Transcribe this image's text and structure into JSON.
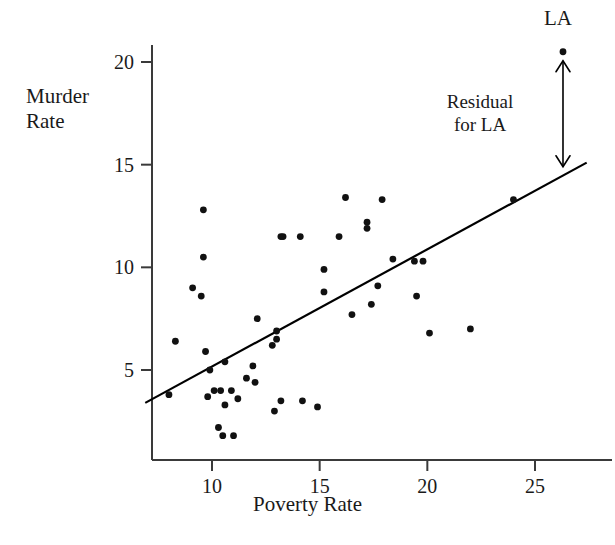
{
  "chart_data": {
    "type": "scatter",
    "title": "",
    "xlabel": "Poverty Rate",
    "ylabel": "Murder Rate",
    "xlim": [
      6.8,
      27.5
    ],
    "ylim": [
      0.5,
      21.5
    ],
    "grid": false,
    "legend": "none",
    "xticks": [
      10,
      15,
      20,
      25
    ],
    "yticks": [
      5,
      10,
      15,
      20
    ],
    "xtick_labels": [
      "10",
      "15",
      "20",
      "25"
    ],
    "ytick_labels": [
      "5",
      "10",
      "15",
      "20"
    ],
    "points": [
      [
        8.0,
        3.8
      ],
      [
        8.3,
        6.4
      ],
      [
        9.1,
        9.0
      ],
      [
        9.6,
        12.8
      ],
      [
        9.6,
        10.5
      ],
      [
        9.5,
        8.6
      ],
      [
        9.7,
        5.9
      ],
      [
        9.9,
        5.0
      ],
      [
        9.8,
        3.7
      ],
      [
        10.1,
        4.0
      ],
      [
        10.3,
        2.2
      ],
      [
        10.4,
        4.0
      ],
      [
        10.5,
        1.8
      ],
      [
        10.6,
        5.4
      ],
      [
        10.6,
        3.3
      ],
      [
        10.9,
        4.0
      ],
      [
        11.0,
        1.8
      ],
      [
        11.2,
        3.6
      ],
      [
        11.6,
        4.6
      ],
      [
        11.9,
        5.2
      ],
      [
        12.0,
        4.4
      ],
      [
        12.1,
        7.5
      ],
      [
        12.8,
        6.2
      ],
      [
        12.9,
        3.0
      ],
      [
        13.0,
        6.9
      ],
      [
        13.0,
        6.5
      ],
      [
        13.2,
        11.5
      ],
      [
        13.3,
        11.5
      ],
      [
        13.2,
        3.5
      ],
      [
        14.1,
        11.5
      ],
      [
        14.2,
        3.5
      ],
      [
        14.9,
        3.2
      ],
      [
        15.2,
        9.9
      ],
      [
        15.2,
        8.8
      ],
      [
        15.9,
        11.5
      ],
      [
        16.2,
        13.4
      ],
      [
        16.5,
        7.7
      ],
      [
        17.2,
        12.2
      ],
      [
        17.2,
        11.9
      ],
      [
        17.4,
        8.2
      ],
      [
        17.7,
        9.1
      ],
      [
        17.9,
        13.3
      ],
      [
        18.4,
        10.4
      ],
      [
        19.4,
        10.3
      ],
      [
        19.8,
        10.3
      ],
      [
        19.5,
        8.6
      ],
      [
        20.1,
        6.8
      ],
      [
        22.0,
        7.0
      ],
      [
        24.0,
        13.3
      ],
      [
        26.3,
        20.5
      ]
    ],
    "regression_line": {
      "x_start": 6.9,
      "y_start": 3.4,
      "x_end": 27.4,
      "y_end": 15.1,
      "label": "least-squares regression line"
    },
    "annotations": [
      {
        "name": "la-point-label",
        "text": "LA",
        "x": 26.3,
        "y": 21.3
      },
      {
        "name": "residual-label",
        "text": "Residual\nfor LA",
        "x": 23.0,
        "y": 17.6
      }
    ],
    "residual_arrow": {
      "x": 26.3,
      "y_top": 20.5,
      "y_bottom": 14.8,
      "double_headed": true
    }
  },
  "axis_titles": {
    "y": "Murder\nRate",
    "x": "Poverty Rate"
  },
  "labels": {
    "la": "LA",
    "residual": "Residual\nfor LA"
  },
  "colors": {
    "point": "#111111",
    "line": "#000000",
    "axis": "#3a3a3a",
    "text": "#1a1a1a",
    "background": "#ffffff"
  }
}
